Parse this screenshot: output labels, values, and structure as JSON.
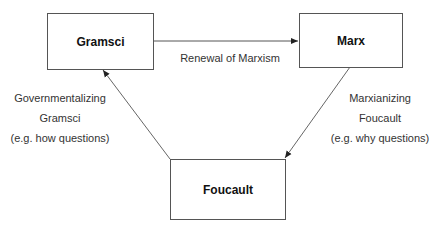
{
  "nodes": {
    "gramsci": {
      "label": "Gramsci"
    },
    "marx": {
      "label": "Marx"
    },
    "foucault": {
      "label": "Foucault"
    }
  },
  "edges": {
    "gramsci_to_marx": {
      "label": "Renewal of Marxism"
    },
    "foucault_to_gramsci": {
      "line1": "Governmentalizing",
      "line2": "Gramsci",
      "line3": "(e.g. how questions)"
    },
    "marx_to_foucault": {
      "line1": "Marxianizing",
      "line2": "Foucault",
      "line3": "(e.g. why questions)"
    }
  },
  "colors": {
    "stroke": "#555555",
    "text": "#222222"
  }
}
